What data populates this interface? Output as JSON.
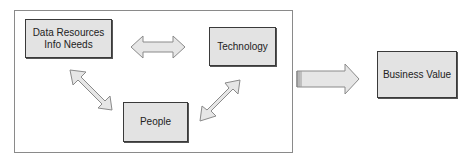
{
  "diagram": {
    "nodes": {
      "data_resources": {
        "line1": "Data Resources",
        "line2": "Info Needs"
      },
      "technology": {
        "label": "Technology"
      },
      "people": {
        "label": "People"
      },
      "business_value": {
        "label": "Business Value"
      }
    },
    "edges": [
      {
        "from": "data_resources",
        "to": "technology",
        "type": "bidirectional"
      },
      {
        "from": "data_resources",
        "to": "people",
        "type": "bidirectional"
      },
      {
        "from": "technology",
        "to": "people",
        "type": "bidirectional"
      },
      {
        "from": "group",
        "to": "business_value",
        "type": "directed"
      }
    ],
    "colors": {
      "box_fill": "#e3e3e3",
      "arrow_fill": "#e6e6e6",
      "stroke": "#8a8a8a"
    }
  }
}
